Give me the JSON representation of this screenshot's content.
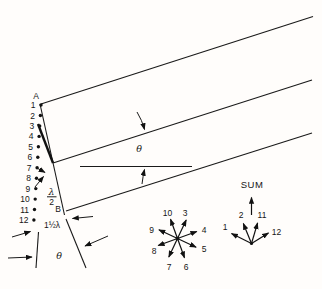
{
  "style": {
    "ink_color": "#1a1a1a",
    "background_color": "#fffdfb"
  },
  "slit": {
    "point_top": "A",
    "point_bottom": "B",
    "sources": [
      "1",
      "2",
      "3",
      "4",
      "5",
      "6",
      "7",
      "8",
      "9",
      "10",
      "11",
      "12"
    ]
  },
  "annotations": {
    "angle_mid": "θ",
    "angle_bottom": "θ",
    "half_wavelength_numerator": "λ",
    "half_wavelength_denominator": "2",
    "path_difference_total": "1½λ"
  },
  "star_phasors": {
    "n3": "3",
    "n4": "4",
    "n5": "5",
    "n6": "6",
    "n7": "7",
    "n8": "8",
    "n9": "9",
    "n10": "10"
  },
  "sum_phasors": {
    "title": "SUM",
    "n1": "1",
    "n2": "2",
    "n11": "11",
    "n12": "12"
  }
}
